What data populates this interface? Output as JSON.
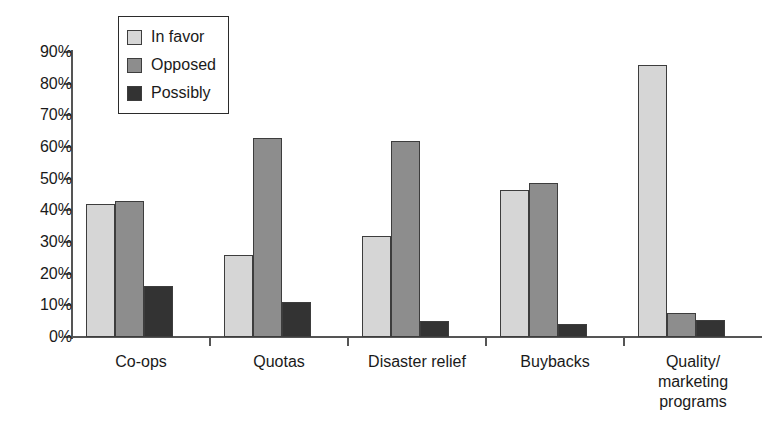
{
  "chart_data": {
    "type": "bar",
    "title": "",
    "subtitle": "",
    "xlabel": "",
    "ylabel": "",
    "ylim": [
      0,
      90
    ],
    "ytick_labels": [
      "90%",
      "80%",
      "70%",
      "60%",
      "50%",
      "40%",
      "30%",
      "20%",
      "10%",
      "0%"
    ],
    "ytick_values": [
      90,
      80,
      70,
      60,
      50,
      40,
      30,
      20,
      10,
      0
    ],
    "grid": false,
    "legend_position": "top-left-inside",
    "categories": [
      "Co-ops",
      "Quotas",
      "Disaster relief",
      "Buybacks",
      "Quality/ marketing programs"
    ],
    "category_label_lines": [
      [
        "Co-ops"
      ],
      [
        "Quotas"
      ],
      [
        "Disaster relief"
      ],
      [
        "Buybacks"
      ],
      [
        "Quality/",
        "marketing",
        "programs"
      ]
    ],
    "series": [
      {
        "name": "In favor",
        "color": "#d6d6d6",
        "values": [
          42,
          26,
          32,
          46.5,
          86
        ]
      },
      {
        "name": "Opposed",
        "color": "#8d8d8d",
        "values": [
          43,
          63,
          62,
          48.5,
          7.5
        ]
      },
      {
        "name": "Possibly",
        "color": "#333333",
        "values": [
          16,
          11,
          5,
          4,
          5.5
        ]
      }
    ]
  },
  "legend": {
    "items": [
      {
        "label": "In favor"
      },
      {
        "label": "Opposed"
      },
      {
        "label": "Possibly"
      }
    ]
  },
  "colors": {
    "in_favor": "#d6d6d6",
    "opposed": "#8d8d8d",
    "possibly": "#333333",
    "axis": "#555555",
    "bar_border": "#3d3d3d",
    "text": "#1a1a1a",
    "background": "#ffffff"
  }
}
